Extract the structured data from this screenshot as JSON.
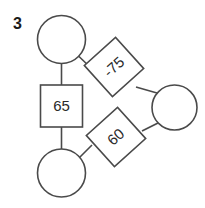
{
  "problem": {
    "number": "3"
  },
  "theme": {
    "stroke_color": "#4a4a4a",
    "text_color": "#2b2b2b",
    "number_color": "#1a1a1a",
    "background": "#ffffff"
  },
  "nodes": [
    {
      "id": "circle-top",
      "shape": "circle",
      "label": "",
      "cx": 61.5,
      "cy": 39.5,
      "r": 24
    },
    {
      "id": "square-65",
      "shape": "square",
      "label": "65",
      "cx": 61.5,
      "cy": 106,
      "size": 42,
      "rotation": 0
    },
    {
      "id": "circle-bottom",
      "shape": "circle",
      "label": "",
      "cx": 61.5,
      "cy": 173,
      "r": 24
    },
    {
      "id": "diamond-75",
      "shape": "square",
      "label": "-75",
      "cx": 114,
      "cy": 67,
      "size": 42,
      "rotation": -42
    },
    {
      "id": "diamond-60",
      "shape": "square",
      "label": "60",
      "cx": 116,
      "cy": 137,
      "size": 42,
      "rotation": -42
    },
    {
      "id": "circle-right",
      "shape": "circle",
      "label": "",
      "cx": 174.5,
      "cy": 107.5,
      "r": 22.5
    }
  ],
  "edges": [
    {
      "id": "edge-top-circle-to-square",
      "from": "circle-top",
      "to": "square-65"
    },
    {
      "id": "edge-square-to-bottom-circle",
      "from": "square-65",
      "to": "circle-bottom"
    },
    {
      "id": "edge-top-circle-to-diamond75",
      "from": "circle-top",
      "to": "diamond-75"
    },
    {
      "id": "edge-diamond75-to-right-circle",
      "from": "diamond-75",
      "to": "circle-right"
    },
    {
      "id": "edge-right-circle-to-diamond60",
      "from": "circle-right",
      "to": "diamond-60"
    },
    {
      "id": "edge-diamond60-to-bottom-circle",
      "from": "diamond-60",
      "to": "circle-bottom"
    }
  ]
}
